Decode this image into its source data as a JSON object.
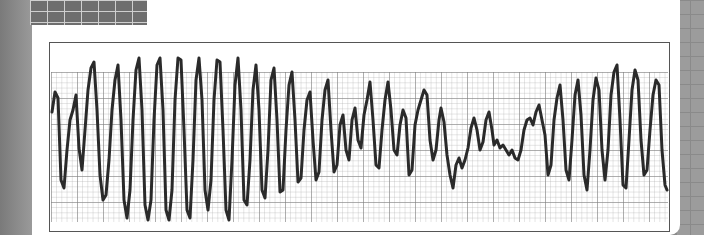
{
  "image": {
    "subject": "ecg-rhythm-strip",
    "description": "Photograph of an ECG rhythm strip on grid paper showing polymorphic ventricular tachycardia with twisting amplitude",
    "colors": {
      "paper": "#ffffff",
      "grid": "#9a9a9a",
      "trace": "#2a2a2a",
      "background": "#8a8a8a"
    }
  },
  "waveform": {
    "points": "52,112 55,92 58,98 61,180 64,188 67,150 70,120 73,110 76,95 79,148 82,170 85,130 88,90 91,68 94,62 97,110 100,175 103,200 106,195 109,160 112,110 115,80 118,65 121,120 124,200 127,218 130,190 133,120 136,70 139,58 142,110 145,205 148,220 151,200 154,120 157,65 160,58 163,110 166,210 169,220 172,190 175,100 178,58 181,60 184,130 187,210 190,218 193,160 196,80 199,58 202,100 205,190 208,210 211,180 214,100 217,60 220,62 223,130 226,210 229,220 232,160 235,85 238,58 241,110 244,200 247,205 250,160 253,90 256,65 259,110 262,190 265,198 268,150 271,80 274,68 277,120 280,192 283,190 286,130 289,85 292,72 295,120 298,182 301,178 304,130 307,100 310,92 313,140 316,180 319,172 322,120 325,90 328,80 331,130 334,172 337,165 340,125 343,115 346,150 349,160 352,120 355,108 358,140 361,148 364,115 367,100 370,82 373,120 376,165 379,168 382,130 385,100 388,82 391,110 394,150 397,155 400,125 403,110 406,118 409,175 412,170 415,125 418,110 421,100 424,90 427,95 430,140 433,160 436,150 439,120 441,108 444,122 447,155 450,175 453,188 456,165 459,158 462,168 465,160 468,148 471,128 474,118 477,130 480,150 483,142 486,120 489,112 492,130 494,145 497,140 500,148 503,145 506,150 509,155 512,150 515,158 518,160 521,150 524,130 527,120 530,118 533,125 536,112 539,105 542,120 545,135 548,175 551,165 554,120 557,98 560,85 563,120 566,170 569,180 572,140 575,95 578,80 581,115 584,175 587,190 590,150 593,100 596,78 599,90 602,150 605,180 608,150 611,95 614,72 617,65 620,120 623,185 626,188 629,140 632,90 635,70 638,80 641,140 644,175 647,170 650,130 653,95 656,80 659,85 662,150 665,185 667,190"
  }
}
